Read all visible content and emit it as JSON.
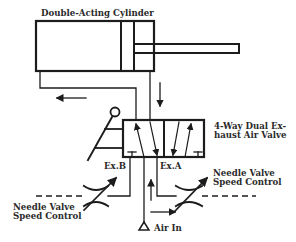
{
  "diagram": {
    "title": "Double-Acting Cylinder",
    "valve_label_line1": "4-Way Dual Ex-",
    "valve_label_line2": "haust Air Valve",
    "exhaust_b": "Ex.B",
    "exhaust_a": "Ex.A",
    "needle_left_line1": "Needle Valve",
    "needle_left_line2": "Speed Control",
    "needle_right_line1": "Needle Valve",
    "needle_right_line2": "Speed Control",
    "air_in": "Air In"
  },
  "colors": {
    "ink": "#1c1c1c",
    "text": "#2a2a2a",
    "background": "#ffffff"
  }
}
